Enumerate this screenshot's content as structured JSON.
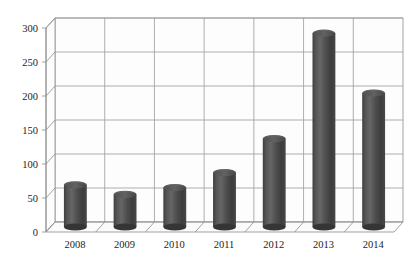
{
  "chart_data": {
    "type": "bar",
    "title": "",
    "subtitle": "",
    "xlabel": "",
    "ylabel": "",
    "categories": [
      "2008",
      "2009",
      "2010",
      "2011",
      "2012",
      "2013",
      "2014"
    ],
    "values": [
      62,
      48,
      58,
      80,
      130,
      285,
      197
    ],
    "series": [
      {
        "name": "",
        "values": [
          62,
          48,
          58,
          80,
          130,
          285,
          197
        ]
      }
    ],
    "ylim": [
      0,
      300
    ],
    "yticks": [
      0,
      50,
      100,
      150,
      200,
      250,
      300
    ],
    "ytick_labels": [
      "0",
      "50",
      "100",
      "150",
      "200",
      "250",
      "300"
    ],
    "grid": true,
    "grid_axis": "y",
    "legend": false,
    "legend_position": "none",
    "annotations": [],
    "style": {
      "bar_style": "3d-cylinder",
      "bar_color": "#4a4a4a",
      "bar_highlight": "#6e6e6e",
      "bar_shadow": "#353535",
      "bar_top_color": "#5c5c5c",
      "plot_background": "#ffffff",
      "axis_color": "#8c8c8c",
      "grid_color": "#9a9a9a",
      "wall_color": "#fdfdfd",
      "floor_color": "#fbfbfb",
      "text_color": "#1c1c1c"
    },
    "plot_geometry": {
      "depth_x": 9,
      "depth_y": 10,
      "front_baseline_y": 232,
      "back_baseline_y": 222,
      "plot_left_front": 46,
      "plot_right_front": 394,
      "value_to_pixels_per_50": 34
    }
  },
  "axes": {
    "y_axis_name": "value-axis",
    "x_axis_name": "year-axis"
  }
}
